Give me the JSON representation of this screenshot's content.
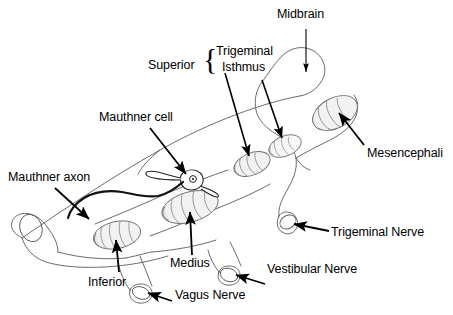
{
  "figure": {
    "type": "anatomical-line-diagram",
    "background_color": "#ffffff",
    "ink_color": "#000000",
    "outline_color": "#555555",
    "nucleus_fill": "#f2f2f2",
    "nucleus_stroke": "#777777"
  },
  "labels": {
    "midbrain": "Midbrain",
    "superior": "Superior",
    "trigeminal": "Trigeminal",
    "isthmus": "Isthmus",
    "mauthner_cell": "Mauthner cell",
    "mauthner_axon": "Mauthner axon",
    "mesencephali": "Mesencephali",
    "trigeminal_nerve": "Trigeminal Nerve",
    "vestibular_nerve": "Vestibular Nerve",
    "vagus_nerve": "Vagus Nerve",
    "medius": "Medius",
    "inferior": "Inferior",
    "brace": "{"
  }
}
